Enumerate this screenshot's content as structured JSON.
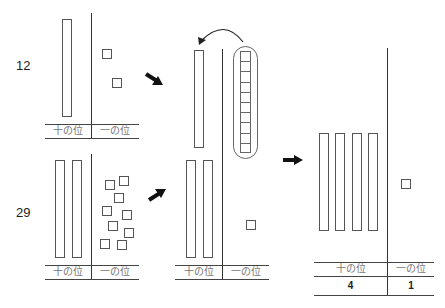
{
  "diagram": {
    "panels": {
      "first": {
        "number": "12",
        "tens_label": "十の位",
        "ones_label": "一の位",
        "tens_rods": 1,
        "ones_cubes": 2
      },
      "second": {
        "number": "29",
        "tens_label": "十の位",
        "ones_label": "一の位",
        "tens_rods": 2,
        "ones_cubes": 9
      },
      "combined": {
        "tens_label": "十の位",
        "ones_label": "一の位",
        "tens_rods": 3,
        "ones_cubes": 1,
        "regroup_stick_cells": 10,
        "regroup_note": "ten ones regrouped into one ten"
      },
      "result": {
        "tens_label": "十の位",
        "ones_label": "一の位",
        "tens_digit": "4",
        "ones_digit": "1",
        "tens_rods": 4,
        "ones_cubes": 1
      }
    },
    "arrows": [
      "arrow-first-to-combined",
      "arrow-second-to-combined",
      "arrow-combined-to-result",
      "regroup-curved-arrow"
    ]
  }
}
